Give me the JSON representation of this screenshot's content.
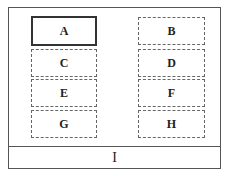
{
  "grid": {
    "boxes": [
      {
        "label": "A",
        "style": "solid"
      },
      {
        "label": "B",
        "style": "dashed"
      },
      {
        "label": "C",
        "style": "dashed"
      },
      {
        "label": "D",
        "style": "dashed"
      },
      {
        "label": "E",
        "style": "dashed"
      },
      {
        "label": "F",
        "style": "dashed"
      },
      {
        "label": "G",
        "style": "dashed"
      },
      {
        "label": "H",
        "style": "dashed"
      }
    ]
  },
  "footer": {
    "label": "I"
  }
}
